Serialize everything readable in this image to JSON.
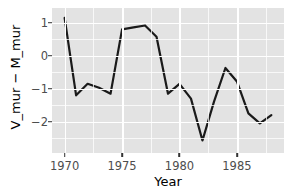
{
  "chart_data": {
    "type": "line",
    "title": "",
    "subtitle": "",
    "xlabel": "Year",
    "ylabel": "V_mur − M_mur",
    "xlim": [
      1968.9,
      1989.1
    ],
    "ylim": [
      -2.95,
      1.45
    ],
    "xticks": [
      1970,
      1975,
      1980,
      1985
    ],
    "xtick_labels": [
      "1970",
      "1975",
      "1980",
      "1985"
    ],
    "yticks": [
      1,
      0,
      -1,
      -2
    ],
    "ytick_labels": [
      "1",
      "0",
      "−1",
      "−2"
    ],
    "x_minor_ticks": [
      1972.5,
      1977.5,
      1982.5,
      1987.5
    ],
    "y_minor_ticks": [
      0.5,
      -0.5,
      -1.5,
      -2.5
    ],
    "grid": true,
    "legend": "none",
    "x": [
      1970,
      1971,
      1972,
      1973,
      1974,
      1975,
      1976,
      1977,
      1978,
      1979,
      1980,
      1981,
      1982,
      1983,
      1984,
      1985,
      1986,
      1987,
      1988
    ],
    "values": [
      1.15,
      -1.2,
      -0.85,
      -0.97,
      -1.15,
      0.8,
      0.86,
      0.92,
      0.58,
      -1.15,
      -0.85,
      -1.3,
      -2.57,
      -1.4,
      -0.37,
      -0.78,
      -1.75,
      -2.05,
      -1.8
    ],
    "series": [
      {
        "name": "V_mur - M_mur",
        "color": "#1a1a1a",
        "line_width": 2.2,
        "values": [
          1.15,
          -1.2,
          -0.85,
          -0.97,
          -1.15,
          0.8,
          0.86,
          0.92,
          0.58,
          -1.15,
          -0.85,
          -1.3,
          -2.57,
          -1.4,
          -0.37,
          -0.78,
          -1.75,
          -2.05,
          -1.8
        ]
      }
    ],
    "panel_background": "#e3e3e3",
    "grid_color": "#ffffff",
    "tick_label_color": "#4d4d4d",
    "axis_title_color": "#000000"
  }
}
